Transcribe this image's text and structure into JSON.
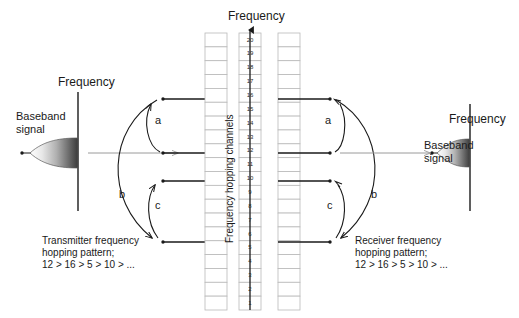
{
  "diagram": {
    "title_top": "Frequency",
    "axis_label_vertical": "Frequency hopping channels",
    "transmitter": {
      "axis_label": "Frequency",
      "signal_label_line1": "Baseband",
      "signal_label_line2": "signal",
      "pattern_line1": "Transmitter frequency",
      "pattern_line2": "hopping pattern;",
      "pattern_line3": "12 > 16 > 5 > 10 > ...",
      "curve_labels": [
        "a",
        "b",
        "c"
      ]
    },
    "receiver": {
      "axis_label": "Frequency",
      "signal_label_line1": "Baseband",
      "signal_label_line2": "signal",
      "pattern_line1": "Receiver frequency",
      "pattern_line2": "hopping pattern;",
      "pattern_line3": "12 > 16 > 5 > 10 > ...",
      "curve_labels": [
        "a",
        "b",
        "c"
      ]
    },
    "channels": [
      20,
      19,
      18,
      17,
      16,
      15,
      14,
      13,
      12,
      11,
      10,
      9,
      8,
      7,
      6,
      5,
      4,
      3,
      2,
      1
    ],
    "active_channels": [
      16,
      12,
      10,
      5
    ],
    "hop_sequence": [
      12,
      16,
      5,
      10
    ],
    "colors": {
      "line": "#1a1a1a",
      "grid": "#b9b9b9",
      "gray_arrow": "#9a9a9a",
      "text": "#1a1a1a"
    }
  }
}
